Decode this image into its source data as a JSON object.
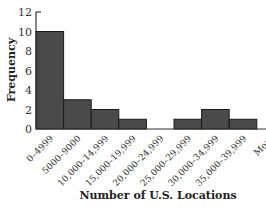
{
  "chart_data": {
    "type": "bar",
    "subtype": "histogram",
    "title": "",
    "xlabel": "Number of U.S. Locations",
    "ylabel": "Frequency",
    "ylim": [
      0,
      12
    ],
    "yticks": [
      "0",
      "2",
      "4",
      "6",
      "8",
      "10",
      "12"
    ],
    "categories": [
      "0–4999",
      "5000–9000",
      "10,000–14,999",
      "15,000–19,999",
      "20,000–24,999",
      "25,000–29,999",
      "30,000–34,999",
      "35,000–39,999",
      "More"
    ],
    "values": [
      10,
      3,
      2,
      1,
      0,
      1,
      2,
      1,
      0
    ],
    "bar_color": "#4a4a4a",
    "grid": false,
    "legend": null
  }
}
